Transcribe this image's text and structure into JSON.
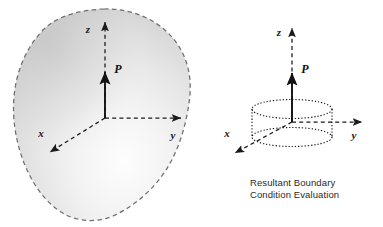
{
  "figure": {
    "background_color": "#ffffff",
    "ink_color": "#1a1a1a",
    "outline_color": "#777777",
    "fill_light": "#fdfdfd",
    "fill_mid": "#e3e3e3",
    "fill_dark": "#c9c9c9"
  },
  "left_diagram": {
    "name": "amorphous-body-with-resultant-force",
    "body_shape": "irregular-blob-dashed-outline",
    "axes": {
      "z_label": "z",
      "y_label": "y",
      "x_label": "x",
      "line_style": "dashed",
      "arrowheads": "solid",
      "origin": [
        105,
        118
      ]
    },
    "force": {
      "label": "P",
      "direction": "up",
      "line_style": "solid"
    }
  },
  "right_diagram": {
    "name": "resultant-boundary-condition-cylinder",
    "body_shape": "cylinder-dotted-outline",
    "axes": {
      "z_label": "z",
      "y_label": "y",
      "x_label": "x",
      "line_style": "dashed",
      "arrowheads": "solid",
      "origin": [
        292,
        122
      ]
    },
    "force": {
      "label": "P",
      "direction": "up",
      "line_style": "solid"
    },
    "caption": {
      "line1": "Resultant Boundary",
      "line2": "Condition Evaluation"
    }
  }
}
